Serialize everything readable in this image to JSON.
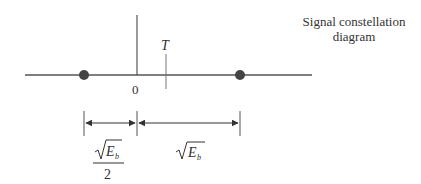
{
  "title": {
    "line1": "Signal constellation",
    "line2": "diagram"
  },
  "axis": {
    "origin_label": "0",
    "threshold_label": "T"
  },
  "signal_points": [
    {
      "name": "s2",
      "position": "-sqrt(Eb)/2"
    },
    {
      "name": "s1",
      "position": "sqrt(Eb)"
    }
  ],
  "dimensions": {
    "left": {
      "numerator_base": "E",
      "numerator_sub": "b",
      "denominator": "2"
    },
    "right": {
      "base": "E",
      "sub": "b"
    }
  },
  "colors": {
    "line": "#555555",
    "point": "#444444",
    "text": "#333333"
  }
}
